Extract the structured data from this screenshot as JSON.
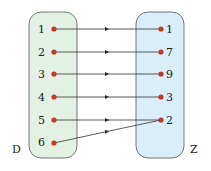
{
  "diagram": {
    "left_set": {
      "name": "D",
      "elements": [
        "1",
        "2",
        "3",
        "4",
        "5",
        "6"
      ],
      "fill": "#e3f1e4"
    },
    "right_set": {
      "name": "Z",
      "elements": [
        "1",
        "7",
        "9",
        "3",
        "2"
      ],
      "fill": "#d9eef8"
    },
    "mapping": [
      {
        "from": "1",
        "to": "1"
      },
      {
        "from": "2",
        "to": "7"
      },
      {
        "from": "3",
        "to": "9"
      },
      {
        "from": "4",
        "to": "3"
      },
      {
        "from": "5",
        "to": "2"
      },
      {
        "from": "6",
        "to": "2"
      }
    ],
    "dot_color": "#c0392b"
  }
}
